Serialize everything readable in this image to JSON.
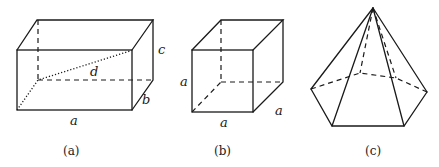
{
  "figures": [
    {
      "id": "a",
      "caption": "(a)",
      "shape": "rectangular box",
      "labels": {
        "length": "a",
        "depth": "b",
        "height": "c",
        "diagonal": "d"
      }
    },
    {
      "id": "b",
      "caption": "(b)",
      "shape": "cube",
      "labels": {
        "height": "a",
        "length": "a",
        "depth": "a"
      }
    },
    {
      "id": "c",
      "caption": "(c)",
      "shape": "hexagonal pyramid",
      "labels": {}
    }
  ]
}
